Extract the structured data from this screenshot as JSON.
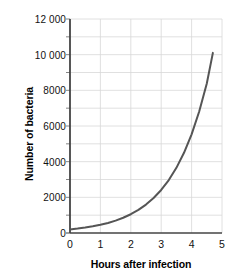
{
  "chart_data": {
    "type": "line",
    "title": "",
    "xlabel": "Hours after infection",
    "ylabel": "Number of bacteria",
    "xlim": [
      0,
      5
    ],
    "ylim": [
      0,
      12000
    ],
    "grid": true,
    "legend": "none",
    "x_ticks": [
      "0",
      "1",
      "2",
      "3",
      "4",
      "5"
    ],
    "x_tick_values": [
      0,
      1,
      2,
      3,
      4,
      5
    ],
    "y_ticks": [
      "0",
      "2000",
      "4000",
      "6000",
      "8000",
      "10 000",
      "12 000"
    ],
    "y_tick_values": [
      0,
      2000,
      4000,
      6000,
      8000,
      10000,
      12000
    ],
    "y_minor_gridline_values": [
      1000,
      3000,
      5000,
      7000,
      9000,
      11000
    ],
    "series": [
      {
        "name": "Bacteria population",
        "color": "#555555",
        "line_width": 2,
        "x": [
          0,
          0.25,
          0.5,
          0.75,
          1,
          1.25,
          1.5,
          1.75,
          2,
          2.25,
          2.5,
          2.75,
          3,
          3.25,
          3.5,
          3.75,
          4,
          4.25,
          4.5,
          4.7
        ],
        "values": [
          200,
          246,
          303,
          373,
          459,
          565,
          695,
          855,
          1052,
          1295,
          1594,
          1961,
          2413,
          2970,
          3654,
          4497,
          5534,
          6810,
          8380,
          10100
        ]
      }
    ],
    "curve_model": "N = 200 * e^(0.8328 * t)",
    "start_point": {
      "x": 0,
      "y": 200
    },
    "end_point": {
      "x": 4.7,
      "y": 10100
    },
    "axis_color": "#444444",
    "gridline_color": "#d8d8d8",
    "background_color": "#ffffff"
  }
}
